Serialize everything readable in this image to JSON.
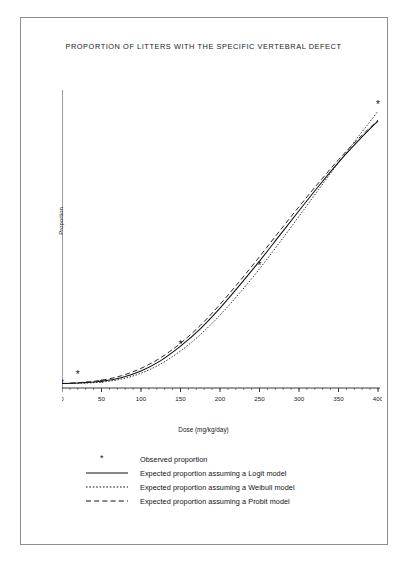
{
  "figure": {
    "title": "PROPORTION OF LITTERS WITH THE SPECIFIC VERTEBRAL DEFECT",
    "border_color": "#8d8d8d"
  },
  "legend": {
    "observed_marker": "*",
    "items": [
      {
        "label": "Observed proportion",
        "marker": "asterisk-marker"
      },
      {
        "label": "Expected proportion assuming a Logit model",
        "marker": "solid-line-marker"
      },
      {
        "label": "Expected proportion assuming a Weibull model",
        "marker": "dotted-line-marker"
      },
      {
        "label": "Expected proportion assuming a Probit model",
        "marker": "dashed-line-marker"
      }
    ]
  },
  "chart_data": {
    "type": "line",
    "title": "PROPORTION OF LITTERS WITH THE SPECIFIC VERTEBRAL DEFECT",
    "xlabel": "Dose (mg/kg/day)",
    "ylabel": "Proportion",
    "xlim": [
      0,
      400
    ],
    "ylim": [
      0.0,
      0.8
    ],
    "xticks": [
      0,
      50,
      100,
      150,
      200,
      250,
      300,
      350,
      400
    ],
    "xtick_labels": [
      "0",
      "50",
      "100",
      "150",
      "200",
      "250",
      "300",
      "350",
      "400"
    ],
    "yticks": [
      0.0,
      0.1,
      0.2,
      0.3,
      0.4,
      0.5,
      0.6,
      0.7,
      0.8
    ],
    "ytick_labels": [
      "0.0",
      "0.1",
      "0.2",
      "0.3",
      "0.4",
      "0.5",
      "0.6",
      "0.7",
      "0.8"
    ],
    "grid": false,
    "minor_ticks": true,
    "legend_position": "below-plot",
    "observed": {
      "name": "Observed proportion",
      "marker": "asterisk",
      "points": [
        {
          "x": 0,
          "y": 0.012
        },
        {
          "x": 20,
          "y": 0.037
        },
        {
          "x": 50,
          "y": 0.013
        },
        {
          "x": 150,
          "y": 0.117
        },
        {
          "x": 250,
          "y": 0.33
        },
        {
          "x": 400,
          "y": 0.765
        }
      ]
    },
    "series": [
      {
        "name": "Expected proportion assuming a Logit model",
        "style": "solid",
        "x": [
          0,
          25,
          50,
          75,
          100,
          125,
          150,
          175,
          200,
          225,
          250,
          275,
          300,
          325,
          350,
          375,
          400
        ],
        "values": [
          0.012,
          0.014,
          0.018,
          0.028,
          0.046,
          0.074,
          0.113,
          0.16,
          0.216,
          0.278,
          0.343,
          0.411,
          0.479,
          0.546,
          0.61,
          0.668,
          0.722
        ]
      },
      {
        "name": "Expected proportion assuming a Weibull model",
        "style": "dotted",
        "x": [
          0,
          25,
          50,
          75,
          100,
          125,
          150,
          175,
          200,
          225,
          250,
          275,
          300,
          325,
          350,
          375,
          400
        ],
        "values": [
          0.012,
          0.013,
          0.016,
          0.024,
          0.04,
          0.065,
          0.1,
          0.144,
          0.197,
          0.257,
          0.322,
          0.392,
          0.464,
          0.537,
          0.609,
          0.679,
          0.748
        ]
      },
      {
        "name": "Expected proportion assuming a Probit model",
        "style": "dashed",
        "x": [
          0,
          25,
          50,
          75,
          100,
          125,
          150,
          175,
          200,
          225,
          250,
          275,
          300,
          325,
          350,
          375,
          400
        ],
        "values": [
          0.012,
          0.015,
          0.021,
          0.033,
          0.053,
          0.082,
          0.121,
          0.169,
          0.226,
          0.289,
          0.355,
          0.423,
          0.49,
          0.555,
          0.617,
          0.673,
          0.724
        ]
      }
    ]
  }
}
